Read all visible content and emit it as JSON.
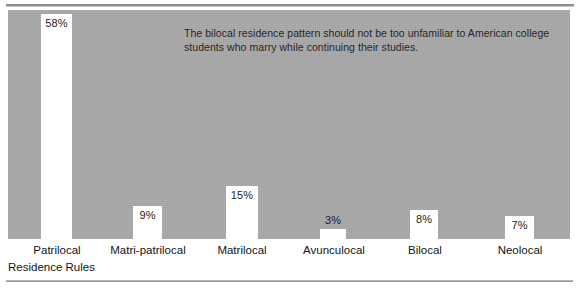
{
  "figure": {
    "annotation_lines": [
      "The bilocal residence pattern should not be too unfamiliar to American college",
      "students who marry while continuing their studies."
    ],
    "axis_title": "Residence Rules",
    "panel_color": "#a8a8a8",
    "bar_color": "#ffffff",
    "text_color": "#1c1c1c"
  },
  "chart_data": {
    "type": "bar",
    "title": "",
    "subtitle": "",
    "xlabel": "Residence Rules",
    "ylabel": "",
    "ylim": [
      0,
      58
    ],
    "grid": false,
    "legend": "none",
    "value_suffix": "%",
    "categories": [
      "Patrilocal",
      "Matri-patrilocal",
      "Matrilocal",
      "Avunculocal",
      "Bilocal",
      "Neolocal"
    ],
    "values": [
      58,
      9,
      15,
      3,
      8,
      7
    ],
    "value_labels": [
      "58%",
      "9%",
      "15%",
      "3%",
      "8%",
      "7%"
    ],
    "annotation": "The bilocal residence pattern should not be too unfamiliar to American college students who marry while continuing their studies."
  },
  "bars": [
    {
      "label": "Patrilocal",
      "value_label": "58%",
      "x": 41,
      "width": 31,
      "top": 14,
      "label_x": 20,
      "label_w": 74,
      "label_inside": true
    },
    {
      "label": "Matri-patrilocal",
      "value_label": "9%",
      "x": 133,
      "width": 29,
      "top": 206,
      "label_x": 97,
      "label_w": 102,
      "label_inside": true
    },
    {
      "label": "Matrilocal",
      "value_label": "15%",
      "x": 226,
      "width": 32,
      "top": 186,
      "label_x": 203,
      "label_w": 78,
      "label_inside": true
    },
    {
      "label": "Avunculocal",
      "value_label": "3%",
      "x": 320,
      "width": 26,
      "top": 229,
      "label_x": 292,
      "label_w": 84,
      "label_inside": false
    },
    {
      "label": "Bilocal",
      "value_label": "8%",
      "x": 410,
      "width": 28,
      "top": 210,
      "label_x": 388,
      "label_w": 74,
      "label_inside": true
    },
    {
      "label": "Neolocal",
      "value_label": "7%",
      "x": 505,
      "width": 29,
      "top": 216,
      "label_x": 480,
      "label_w": 80,
      "label_inside": true
    }
  ]
}
